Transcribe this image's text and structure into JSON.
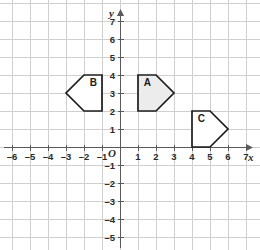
{
  "chart_data": {
    "type": "scatter",
    "title": "",
    "xlabel": "x",
    "ylabel": "y",
    "origin_label": "O",
    "grid": true,
    "legend": "none",
    "xlim": [
      -6.9,
      7.7
    ],
    "ylim": [
      -5.9,
      7.7
    ],
    "x_ticks": [
      -6,
      -5,
      -4,
      -3,
      -2,
      -1,
      1,
      2,
      3,
      4,
      5,
      6,
      7
    ],
    "y_ticks": [
      -5,
      -4,
      -3,
      -2,
      -1,
      1,
      2,
      3,
      4,
      5,
      6,
      7
    ],
    "x_tick_labels": [
      "–6",
      "–5",
      "–4",
      "–3",
      "–2",
      "–1",
      "1",
      "2",
      "3",
      "4",
      "5",
      "6",
      "7"
    ],
    "y_tick_labels": [
      "–5",
      "–4",
      "–3",
      "–2",
      "–1",
      "1",
      "2",
      "3",
      "4",
      "5",
      "6",
      "7"
    ],
    "shapes": [
      {
        "label": "A",
        "vertices": [
          [
            1,
            2
          ],
          [
            1,
            4
          ],
          [
            2,
            4
          ],
          [
            3,
            3
          ],
          [
            2,
            2
          ]
        ],
        "fill": "#ececec",
        "stroke": "#1c1c1c",
        "label_x": 1.52,
        "label_y": 3.38
      },
      {
        "label": "B",
        "vertices": [
          [
            -1,
            2
          ],
          [
            -1,
            4
          ],
          [
            -2,
            4
          ],
          [
            -3,
            3
          ],
          [
            -2,
            2
          ]
        ],
        "fill": "#ffffff",
        "stroke": "#1c1c1c",
        "label_x": -1.48,
        "label_y": 3.38
      },
      {
        "label": "C",
        "vertices": [
          [
            4,
            0
          ],
          [
            4,
            2
          ],
          [
            5,
            2
          ],
          [
            6,
            1
          ],
          [
            5,
            0
          ]
        ],
        "fill": "#ffffff",
        "stroke": "#1c1c1c",
        "label_x": 4.52,
        "label_y": 1.38
      }
    ]
  },
  "colors": {
    "grid": "#cfcfcf",
    "axis": "#5a5a5a",
    "shape_stroke": "#1c1c1c",
    "shape_a_fill": "#ececec",
    "background": "#ffffff"
  }
}
